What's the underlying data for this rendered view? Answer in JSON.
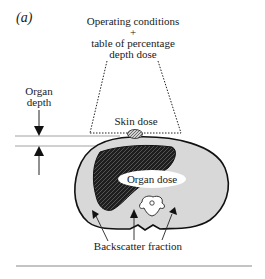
{
  "figure": {
    "panel_label": "(a)",
    "source": {
      "line1": "Operating conditions",
      "line2": "+",
      "line3": "table of percentage",
      "line4": "depth dose"
    },
    "organ_depth": {
      "line1": "Organ",
      "line2": "depth"
    },
    "skin_dose": "Skin dose",
    "organ_dose": "Organ dose",
    "backscatter": "Backscatter fraction",
    "colors": {
      "body_fill": "#d8d8d8",
      "organ_fill": "#1e1e1e",
      "outline": "#111111",
      "divider": "#8a8a8a"
    }
  }
}
